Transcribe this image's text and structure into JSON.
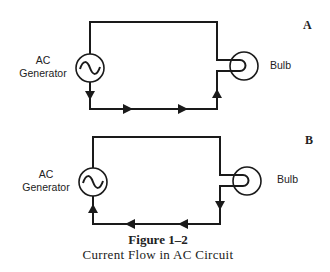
{
  "figure": {
    "number": "Figure 1–2",
    "caption": "Current Flow in AC Circuit"
  },
  "panels": [
    {
      "label": "A",
      "generator_label_line1": "AC",
      "generator_label_line2": "Generator",
      "load_label": "Bulb",
      "current_direction": "clockwise-bottom: down from generator, right along bottom wire, up into bulb"
    },
    {
      "label": "B",
      "generator_label_line1": "AC",
      "generator_label_line2": "Generator",
      "load_label": "Bulb",
      "current_direction": "reversed: down from bulb, left along bottom wire, up into generator"
    }
  ],
  "icons": {
    "generator": "ac-sine-wave-source",
    "bulb": "lamp-with-filament-loop",
    "arrow": "triangle-arrowhead"
  },
  "colors": {
    "line": "#1a1a1a",
    "background": "#ffffff",
    "text": "#222222"
  }
}
